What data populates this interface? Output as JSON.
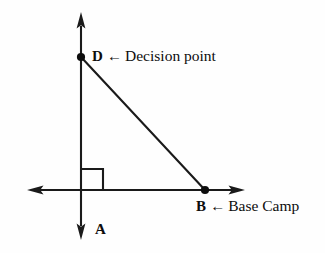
{
  "diagram": {
    "type": "right-triangle-geometry",
    "background_color": "#fefefe",
    "stroke_color": "#1a1a1a",
    "axes": {
      "vertical": {
        "name": "vertical-axis",
        "x": 81,
        "y_top": 12,
        "y_bottom": 240,
        "double_headed": true
      },
      "horizontal": {
        "name": "horizontal-axis",
        "y": 190,
        "x_left": 27,
        "x_right": 245,
        "double_headed": true
      },
      "origin": {
        "x": 81,
        "y": 190
      }
    },
    "points": [
      {
        "id": "D",
        "label": "D",
        "x": 81,
        "y": 57,
        "marker": "filled-dot",
        "on_axis": "vertical"
      },
      {
        "id": "B",
        "label": "B",
        "x": 205,
        "y": 190,
        "marker": "filled-dot",
        "on_axis": "horizontal"
      },
      {
        "id": "A",
        "label": "A",
        "x": 81,
        "y": 240,
        "marker": "none",
        "on_axis": "vertical"
      }
    ],
    "segments": [
      {
        "id": "hypotenuse-DB",
        "from": "D",
        "to": "B"
      }
    ],
    "right_angle": {
      "name": "right-angle-marker",
      "vertex_x": 81,
      "vertex_y": 190,
      "size": 22,
      "quadrant": "upper-right"
    },
    "labels": {
      "decision_point": {
        "point": "D",
        "arrow": "←",
        "text": "Decision point"
      },
      "base_camp": {
        "point": "B",
        "arrow": "←",
        "text": "Base Camp"
      },
      "a_point": {
        "point": "A",
        "arrow": "",
        "text": ""
      }
    }
  }
}
